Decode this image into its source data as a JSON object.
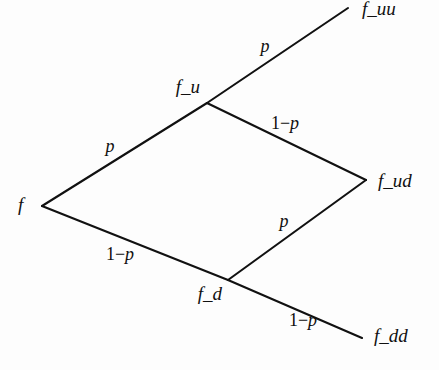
{
  "figure": {
    "type": "binomial-recombining-tree",
    "background_color": "#fdfdfd",
    "line_color": "#111111",
    "text_color": "#101010",
    "width": 439,
    "height": 370
  },
  "nodes": [
    {
      "id": "root",
      "label": "f",
      "x": 42,
      "y": 206,
      "label_x": 18,
      "label_y": 207,
      "anchor": "start"
    },
    {
      "id": "up",
      "label": "f_u",
      "x": 207,
      "y": 103,
      "label_x": 200,
      "label_y": 89,
      "anchor": "end"
    },
    {
      "id": "down",
      "label": "f_d",
      "x": 228,
      "y": 280,
      "label_x": 222,
      "label_y": 296,
      "anchor": "end"
    },
    {
      "id": "upup",
      "label": "f_uu",
      "x": 348,
      "y": 8,
      "label_x": 362,
      "label_y": 11,
      "anchor": "start"
    },
    {
      "id": "updown",
      "label": "f_ud",
      "x": 366,
      "y": 180,
      "label_x": 378,
      "label_y": 183,
      "anchor": "start"
    },
    {
      "id": "downdown",
      "label": "f_dd",
      "x": 362,
      "y": 338,
      "label_x": 374,
      "label_y": 338,
      "anchor": "start"
    }
  ],
  "edges": [
    {
      "id": "root-up",
      "from": "root",
      "to": "up",
      "x1": 42,
      "y1": 206,
      "x2": 207,
      "y2": 103
    },
    {
      "id": "root-down",
      "from": "root",
      "to": "down",
      "x1": 42,
      "y1": 206,
      "x2": 228,
      "y2": 280
    },
    {
      "id": "up-upup",
      "from": "up",
      "to": "upup",
      "x1": 207,
      "y1": 103,
      "x2": 348,
      "y2": 8
    },
    {
      "id": "up-updown",
      "from": "up",
      "to": "updown",
      "x1": 207,
      "y1": 103,
      "x2": 366,
      "y2": 180
    },
    {
      "id": "down-updown",
      "from": "down",
      "to": "updown",
      "x1": 228,
      "y1": 280,
      "x2": 366,
      "y2": 180
    },
    {
      "id": "down-downdown",
      "from": "down",
      "to": "downdown",
      "x1": 228,
      "y1": 280,
      "x2": 362,
      "y2": 338
    }
  ],
  "edge_labels": [
    {
      "id": "p-root-up",
      "edge": "root-up",
      "text": "p",
      "kind": "simple",
      "x": 110,
      "y": 148
    },
    {
      "id": "p-up-upup",
      "edge": "up-upup",
      "text": "p",
      "kind": "simple",
      "x": 265,
      "y": 48
    },
    {
      "id": "p-down-updown",
      "edge": "down-updown",
      "text": "p",
      "kind": "simple",
      "x": 284,
      "y": 223
    },
    {
      "id": "oneminusp-up-updown",
      "edge": "up-updown",
      "prefix": "1−",
      "text": "p",
      "kind": "compound",
      "x": 285,
      "y": 125
    },
    {
      "id": "oneminusp-root-down",
      "edge": "root-down",
      "prefix": "1−",
      "text": "p",
      "kind": "compound",
      "x": 120,
      "y": 256
    },
    {
      "id": "oneminusp-down-downdown",
      "edge": "down-downdown",
      "prefix": "1−",
      "text": "p",
      "kind": "compound",
      "x": 303,
      "y": 322
    }
  ]
}
